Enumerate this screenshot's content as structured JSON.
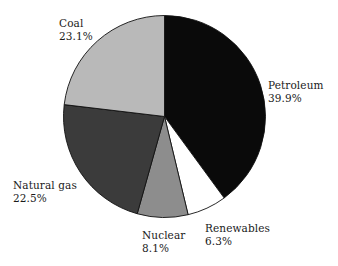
{
  "chart_data": {
    "type": "pie",
    "title": "",
    "subtitle": "",
    "xlabel": "",
    "ylabel": "",
    "legend_position": "none",
    "grid": false,
    "units": "percent",
    "start_angle_deg": 0,
    "direction": "clockwise",
    "categories": [
      "Petroleum",
      "Renewables",
      "Nuclear",
      "Natural gas",
      "Coal"
    ],
    "values": [
      39.9,
      6.3,
      8.1,
      22.5,
      23.1
    ],
    "slices": [
      {
        "name": "Petroleum",
        "value": 39.9,
        "value_label": "39.9%",
        "color": "#0a0a0a",
        "stroke": "#111111",
        "label_id": "label-petroleum"
      },
      {
        "name": "Renewables",
        "value": 6.3,
        "value_label": "6.3%",
        "color": "#ffffff",
        "stroke": "#111111",
        "label_id": "label-renewables"
      },
      {
        "name": "Nuclear",
        "value": 8.1,
        "value_label": "8.1%",
        "color": "#8d8d8d",
        "stroke": "#111111",
        "label_id": "label-nuclear"
      },
      {
        "name": "Natural gas",
        "value": 22.5,
        "value_label": "22.5%",
        "color": "#3b3b3b",
        "stroke": "#111111",
        "label_id": "label-natural-gas"
      },
      {
        "name": "Coal",
        "value": 23.1,
        "value_label": "23.1%",
        "color": "#b9b9b9",
        "stroke": "#111111",
        "label_id": "label-coal"
      }
    ],
    "geometry": {
      "center_x": 164.5,
      "center_y": 116.5,
      "radius": 101
    },
    "colors": {
      "background": "#ffffff",
      "text": "#1a1a1a",
      "outline": "#111111"
    }
  }
}
